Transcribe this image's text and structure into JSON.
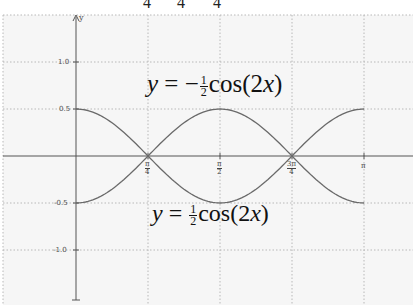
{
  "chart_data": {
    "type": "line",
    "title": "",
    "xlabel": "",
    "ylabel": "y",
    "xlim": [
      -1.05,
      3.6
    ],
    "ylim": [
      -1.5,
      1.5
    ],
    "grid": true,
    "x_ticks": [
      "π/4",
      "π/2",
      "3π/4",
      "π"
    ],
    "y_ticks": [
      "1.0",
      "0.5",
      "-0.5",
      "-1.0"
    ],
    "series": [
      {
        "name": "y = -1/2 cos(2x)",
        "x": [
          0,
          0.785,
          1.571,
          2.356,
          3.142
        ],
        "values": [
          -0.5,
          0,
          0.5,
          0,
          -0.5
        ]
      },
      {
        "name": "y = 1/2 cos(2x)",
        "x": [
          0,
          0.785,
          1.571,
          2.356,
          3.142
        ],
        "values": [
          0.5,
          0,
          -0.5,
          0,
          0.5
        ]
      }
    ],
    "annotations": [
      "y = -½cos(2x)",
      "y = ½cos(2x)"
    ]
  },
  "labels": {
    "top_partial": [
      "4",
      "4",
      "4"
    ],
    "y_axis": "y",
    "y_ticks": [
      "1.0",
      "0.5",
      "-0.5",
      "-1.0"
    ],
    "x_ticks": [
      {
        "num": "π",
        "den": "4"
      },
      {
        "num": "π",
        "den": "2"
      },
      {
        "num": "3π",
        "den": "4"
      },
      {
        "num": "π",
        "den": ""
      }
    ],
    "eq_top": {
      "lhs": "y",
      "eq": "=",
      "sign": "−",
      "num": "1",
      "den": "2",
      "fn": "cos(2",
      "var": "x",
      "close": ")"
    },
    "eq_bottom": {
      "lhs": "y",
      "eq": "=",
      "sign": "",
      "num": "1",
      "den": "2",
      "fn": "cos(2",
      "var": "x",
      "close": ")"
    }
  }
}
